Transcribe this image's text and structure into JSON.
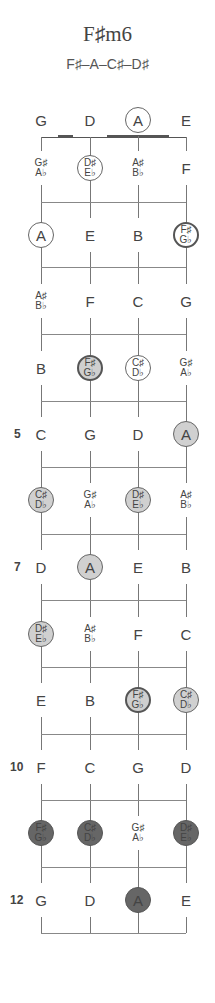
{
  "chord": {
    "title": "F♯m6",
    "notes": "F♯–A–C♯–D♯"
  },
  "strings": [
    "G",
    "D",
    "A",
    "E"
  ],
  "fret_numbers": [
    {
      "fret": 5,
      "label": "5"
    },
    {
      "fret": 7,
      "label": "7"
    },
    {
      "fret": 10,
      "label": "10"
    },
    {
      "fret": 12,
      "label": "12"
    }
  ],
  "rows": [
    {
      "fret": 0,
      "cells": [
        {
          "top": "G",
          "style": "none"
        },
        {
          "top": "D",
          "style": "none"
        },
        {
          "top": "A",
          "style": "open"
        },
        {
          "top": "E",
          "style": "none"
        }
      ]
    },
    {
      "fret": 1,
      "cells": [
        {
          "top": "G♯",
          "bottom": "A♭",
          "style": "none"
        },
        {
          "top": "D♯",
          "bottom": "E♭",
          "style": "open"
        },
        {
          "top": "A♯",
          "bottom": "B♭",
          "style": "none"
        },
        {
          "top": "F",
          "style": "none"
        }
      ]
    },
    {
      "fret": 2,
      "cells": [
        {
          "top": "A",
          "style": "open"
        },
        {
          "top": "E",
          "style": "none"
        },
        {
          "top": "B",
          "style": "none"
        },
        {
          "top": "F♯",
          "bottom": "G♭",
          "style": "white-bold"
        }
      ]
    },
    {
      "fret": 3,
      "cells": [
        {
          "top": "A♯",
          "bottom": "B♭",
          "style": "none"
        },
        {
          "top": "F",
          "style": "none"
        },
        {
          "top": "C",
          "style": "none"
        },
        {
          "top": "G",
          "style": "none"
        }
      ]
    },
    {
      "fret": 4,
      "cells": [
        {
          "top": "B",
          "style": "none"
        },
        {
          "top": "F♯",
          "bottom": "G♭",
          "style": "light-bold"
        },
        {
          "top": "C♯",
          "bottom": "D♭",
          "style": "open"
        },
        {
          "top": "G♯",
          "bottom": "A♭",
          "style": "none"
        }
      ]
    },
    {
      "fret": 5,
      "cells": [
        {
          "top": "C",
          "style": "none"
        },
        {
          "top": "G",
          "style": "none"
        },
        {
          "top": "D",
          "style": "none"
        },
        {
          "top": "A",
          "style": "light"
        }
      ]
    },
    {
      "fret": 6,
      "cells": [
        {
          "top": "C♯",
          "bottom": "D♭",
          "style": "light"
        },
        {
          "top": "G♯",
          "bottom": "A♭",
          "style": "none"
        },
        {
          "top": "D♯",
          "bottom": "E♭",
          "style": "light"
        },
        {
          "top": "A♯",
          "bottom": "B♭",
          "style": "none"
        }
      ]
    },
    {
      "fret": 7,
      "cells": [
        {
          "top": "D",
          "style": "none"
        },
        {
          "top": "A",
          "style": "light"
        },
        {
          "top": "E",
          "style": "none"
        },
        {
          "top": "B",
          "style": "none"
        }
      ]
    },
    {
      "fret": 8,
      "cells": [
        {
          "top": "D♯",
          "bottom": "E♭",
          "style": "light"
        },
        {
          "top": "A♯",
          "bottom": "B♭",
          "style": "none"
        },
        {
          "top": "F",
          "style": "none"
        },
        {
          "top": "C",
          "style": "none"
        }
      ]
    },
    {
      "fret": 9,
      "cells": [
        {
          "top": "E",
          "style": "none"
        },
        {
          "top": "B",
          "style": "none"
        },
        {
          "top": "F♯",
          "bottom": "G♭",
          "style": "light-bold"
        },
        {
          "top": "C♯",
          "bottom": "D♭",
          "style": "light"
        }
      ]
    },
    {
      "fret": 10,
      "cells": [
        {
          "top": "F",
          "style": "none"
        },
        {
          "top": "C",
          "style": "none"
        },
        {
          "top": "G",
          "style": "none"
        },
        {
          "top": "D",
          "style": "none"
        }
      ]
    },
    {
      "fret": 11,
      "cells": [
        {
          "top": "F♯",
          "bottom": "G♭",
          "style": "dark"
        },
        {
          "top": "C♯",
          "bottom": "D♭",
          "style": "dark"
        },
        {
          "top": "G♯",
          "bottom": "A♭",
          "style": "none"
        },
        {
          "top": "D♯",
          "bottom": "E♭",
          "style": "dark"
        }
      ]
    },
    {
      "fret": 12,
      "cells": [
        {
          "top": "G",
          "style": "none"
        },
        {
          "top": "D",
          "style": "none"
        },
        {
          "top": "A",
          "style": "dark"
        },
        {
          "top": "E",
          "style": "none"
        }
      ]
    }
  ],
  "colors": {
    "light_fill": "#d0d0d0",
    "dark_fill": "#666666",
    "line": "#777777"
  }
}
